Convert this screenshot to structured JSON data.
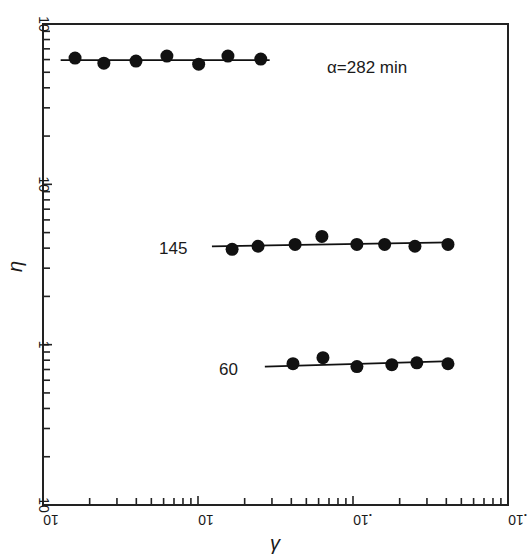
{
  "chart_data": {
    "type": "scatter",
    "title": "",
    "xlabel": "γ",
    "ylabel": "η",
    "xscale": "log",
    "yscale": "log",
    "xlim": [
      1,
      1000
    ],
    "ylim": [
      0.1,
      100
    ],
    "x_tick_labels": [
      "10^0",
      "10",
      "10^2",
      "10^3"
    ],
    "y_tick_labels": [
      "10^-1",
      "1",
      "10",
      "10^2"
    ],
    "grid": false,
    "legend": null,
    "series": [
      {
        "name": "α=282 min",
        "label": "α=282 min",
        "x": [
          1.61,
          2.47,
          3.98,
          6.3,
          10.1,
          15.6,
          25.4
        ],
        "y": [
          61.3,
          57.0,
          58.7,
          63.1,
          56.2,
          63.1,
          60.4
        ],
        "fit_line": {
          "x": [
            1.3,
            29
          ],
          "y": [
            59.5,
            59.5
          ]
        }
      },
      {
        "name": "145",
        "label": "145",
        "x": [
          16.6,
          24.4,
          42.3,
          63.0,
          105.9,
          160,
          251,
          410
        ],
        "y": [
          3.93,
          4.11,
          4.22,
          4.73,
          4.22,
          4.22,
          4.11,
          4.22
        ],
        "fit_line": {
          "x": [
            12.3,
            420
          ],
          "y": [
            4.1,
            4.35
          ]
        }
      },
      {
        "name": "60",
        "label": "60",
        "x": [
          41,
          64,
          106,
          178,
          258,
          410
        ],
        "y": [
          0.761,
          0.83,
          0.73,
          0.75,
          0.77,
          0.76
        ],
        "fit_line": {
          "x": [
            27,
            430
          ],
          "y": [
            0.73,
            0.79
          ]
        }
      }
    ],
    "annotations": [
      {
        "text": "α=282 min",
        "near_series": 0
      },
      {
        "text": "145",
        "near_series": 1
      },
      {
        "text": "60",
        "near_series": 2
      }
    ]
  },
  "labels": {
    "xlabel": "γ",
    "ylabel": "η",
    "series_282": "α=282 min",
    "series_145": "145",
    "series_60": "60"
  }
}
